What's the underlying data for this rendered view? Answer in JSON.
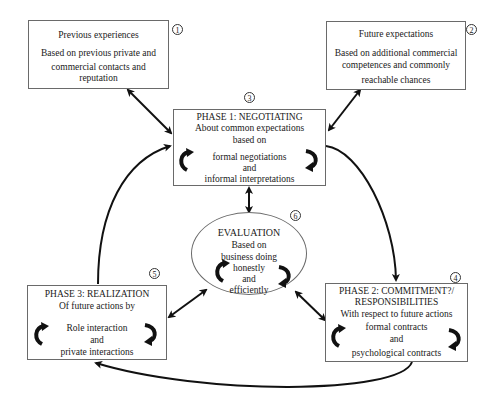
{
  "diagram": {
    "nodes": {
      "previous": {
        "number": "1",
        "title": "Previous experiences",
        "lines": [
          "Based on previous private and",
          "commercial contacts and",
          "reputation"
        ]
      },
      "future": {
        "number": "2",
        "title": "Future expectations",
        "lines": [
          "Based on additional commercial",
          "competences and commonly",
          "reachable chances"
        ]
      },
      "phase1": {
        "number": "3",
        "title": "PHASE 1: NEGOTIATING",
        "lines": [
          "About common expectations",
          "based on",
          "formal negotiations",
          "and",
          "informal interpretations"
        ]
      },
      "phase2": {
        "number": "4",
        "title": "PHASE 2: COMMITMENT?/",
        "title2": "RESPONSIBILITIES",
        "lines": [
          "With respect to future actions",
          "formal contracts",
          "and",
          "psychological contracts"
        ]
      },
      "phase3": {
        "number": "5",
        "title": "PHASE 3: REALIZATION",
        "lines": [
          "Of future actions by",
          "Role interaction",
          "and",
          "private interactions"
        ]
      },
      "evaluation": {
        "number": "6",
        "title": "EVALUATION",
        "lines": [
          "Based on",
          "business doing",
          "honestly",
          "and",
          "efficiently"
        ]
      }
    },
    "edges": [
      {
        "from": "previous",
        "to": "phase1",
        "type": "bidirectional"
      },
      {
        "from": "future",
        "to": "phase1",
        "type": "bidirectional"
      },
      {
        "from": "phase1",
        "to": "phase2",
        "type": "directed-curve"
      },
      {
        "from": "phase2",
        "to": "phase3",
        "type": "directed-curve"
      },
      {
        "from": "phase3",
        "to": "phase1",
        "type": "directed-curve"
      },
      {
        "from": "evaluation",
        "to": "phase1",
        "type": "bidirectional"
      },
      {
        "from": "evaluation",
        "to": "phase2",
        "type": "bidirectional"
      },
      {
        "from": "evaluation",
        "to": "phase3",
        "type": "bidirectional"
      }
    ]
  }
}
